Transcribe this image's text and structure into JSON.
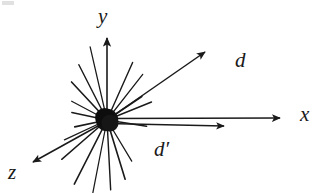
{
  "figure": {
    "caption_type": "vector-diagram",
    "background_color": "#ffffff",
    "ink_color": "#1a1a1a",
    "labels": {
      "y_axis": "y",
      "x_axis": "x",
      "z_axis": "z",
      "vector_d": "d",
      "vector_d_prime": "d′"
    }
  },
  "chart_data": {
    "type": "scatter",
    "title": "",
    "xlabel": "x",
    "ylabel": "y",
    "zlabel": "z",
    "legend": [],
    "grid": false,
    "origin_px": {
      "x": 107,
      "y": 120
    },
    "node": {
      "name": "origin-blob",
      "radius_px": 11,
      "fill": "#121212"
    },
    "axes": [
      {
        "name": "y",
        "label": "y",
        "from": [
          107,
          120
        ],
        "to": [
          107,
          36
        ],
        "arrow": true
      },
      {
        "name": "x",
        "label": "x",
        "from": [
          107,
          119
        ],
        "to": [
          284,
          118
        ],
        "arrow": true
      },
      {
        "name": "z",
        "label": "z",
        "from": [
          107,
          121
        ],
        "to": [
          31,
          163
        ],
        "arrow": true
      }
    ],
    "vectors": [
      {
        "name": "d",
        "label": "d",
        "from": [
          107,
          120
        ],
        "to": [
          208,
          50
        ],
        "arrow": true
      },
      {
        "name": "d-prime",
        "label": "d′",
        "from": [
          107,
          123
        ],
        "to": [
          228,
          126
        ],
        "arrow": true
      }
    ],
    "spokes": [
      {
        "angle_deg": 103,
        "length_px": 75
      },
      {
        "angle_deg": 117,
        "length_px": 62
      },
      {
        "angle_deg": 133,
        "length_px": 52
      },
      {
        "angle_deg": 152,
        "length_px": 40
      },
      {
        "angle_deg": 168,
        "length_px": 36
      },
      {
        "angle_deg": 192,
        "length_px": 33
      },
      {
        "angle_deg": 205,
        "length_px": 47
      },
      {
        "angle_deg": 221,
        "length_px": 60
      },
      {
        "angle_deg": 243,
        "length_px": 72
      },
      {
        "angle_deg": 259,
        "length_px": 74
      },
      {
        "angle_deg": 273,
        "length_px": 70
      },
      {
        "angle_deg": 287,
        "length_px": 62
      },
      {
        "angle_deg": 301,
        "length_px": 48
      },
      {
        "angle_deg": 22,
        "length_px": 48
      },
      {
        "angle_deg": 34,
        "length_px": 42
      },
      {
        "angle_deg": 52,
        "length_px": 58
      },
      {
        "angle_deg": 66,
        "length_px": 63
      },
      {
        "angle_deg": 351,
        "length_px": 40
      }
    ]
  }
}
